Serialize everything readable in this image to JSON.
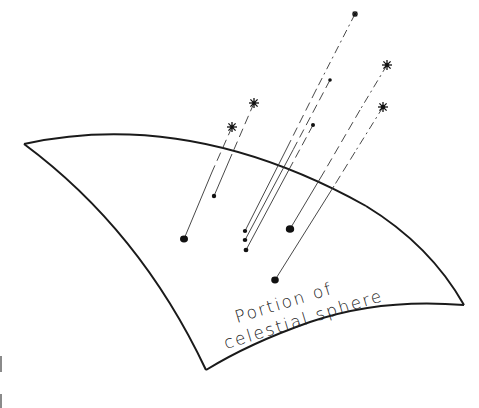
{
  "label": {
    "line1": "Portion   of",
    "line2": "celestial  sphere"
  },
  "colors": {
    "background": "#ffffff",
    "ink": "#1a1a1a"
  },
  "diagram": {
    "surface": {
      "corners": {
        "top_left": [
          24,
          144
        ],
        "bottom_left": [
          206,
          370
        ],
        "bottom_right": [
          464,
          305
        ]
      }
    },
    "stars": [
      {
        "id": "star-1",
        "x": 232,
        "y": 127
      },
      {
        "id": "star-2",
        "x": 254,
        "y": 103
      },
      {
        "id": "star-3",
        "x": 355,
        "y": 14
      },
      {
        "id": "star-4",
        "x": 387,
        "y": 65
      },
      {
        "id": "star-5",
        "x": 383,
        "y": 107
      }
    ],
    "far_dots": [
      {
        "id": "far-dot-1",
        "x": 330,
        "y": 80
      },
      {
        "id": "far-dot-2",
        "x": 313,
        "y": 125
      },
      {
        "id": "far-dot-3",
        "x": 214,
        "y": 196
      }
    ],
    "projections": [
      {
        "id": "proj-1",
        "x": 184,
        "y": 239,
        "size": "large"
      },
      {
        "id": "proj-2",
        "x": 245,
        "y": 231,
        "size": "small"
      },
      {
        "id": "proj-3",
        "x": 245,
        "y": 240,
        "size": "small"
      },
      {
        "id": "proj-4",
        "x": 246,
        "y": 250,
        "size": "small"
      },
      {
        "id": "proj-5",
        "x": 290,
        "y": 229,
        "size": "large"
      },
      {
        "id": "proj-6",
        "x": 275,
        "y": 280,
        "size": "large"
      }
    ]
  }
}
